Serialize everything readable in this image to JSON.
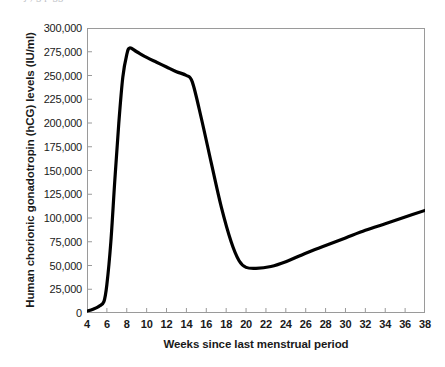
{
  "page": {
    "cut_off_text_sliver": "j                  ,                      g  p              gg"
  },
  "chart_data": {
    "type": "line",
    "title": "",
    "xlabel": "Weeks since last menstrual period",
    "ylabel": "Human chorionic gonadotropin (hCG) levels (IU/ml)",
    "xlim": [
      4,
      38
    ],
    "ylim": [
      0,
      300000
    ],
    "xticks": [
      4,
      6,
      8,
      10,
      12,
      14,
      16,
      18,
      20,
      22,
      24,
      26,
      28,
      30,
      32,
      34,
      36,
      38
    ],
    "xtick_labels": [
      "4",
      "6",
      "8",
      "10",
      "12",
      "14",
      "16",
      "18",
      "20",
      "22",
      "24",
      "26",
      "28",
      "30",
      "32",
      "34",
      "36",
      "38"
    ],
    "yticks": [
      0,
      25000,
      50000,
      75000,
      100000,
      125000,
      150000,
      175000,
      200000,
      225000,
      250000,
      275000,
      300000
    ],
    "ytick_labels": [
      "0",
      "25,000",
      "50,000",
      "75,000",
      "100,000",
      "125,000",
      "150,000",
      "175,000",
      "200,000",
      "225,000",
      "250,000",
      "275,000",
      "300,000"
    ],
    "grid": false,
    "legend": null,
    "line_color": "#000000",
    "line_width": 3.2,
    "frame_color": "#9a9a9a",
    "series": [
      {
        "name": "hCG level",
        "x": [
          4,
          4.6,
          5.2,
          5.7,
          6.0,
          6.4,
          6.8,
          7.2,
          7.6,
          8.0,
          8.3,
          9.0,
          10.0,
          11.0,
          12.0,
          13.0,
          14.0,
          14.6,
          15.5,
          16.5,
          17.5,
          18.5,
          19.3,
          20.0,
          21.0,
          22.5,
          24.0,
          26.0,
          28.0,
          30.0,
          32.0,
          34.0,
          36.0,
          38.0
        ],
        "y": [
          2000,
          4000,
          7000,
          12000,
          30000,
          75000,
          140000,
          200000,
          248000,
          272000,
          279000,
          275000,
          269000,
          264000,
          259000,
          254000,
          250000,
          243000,
          205000,
          158000,
          112000,
          75000,
          55000,
          48000,
          47000,
          49000,
          54000,
          63000,
          71000,
          79000,
          87000,
          94000,
          101000,
          108000
        ]
      }
    ],
    "annotations": {
      "peak_week": 8.3,
      "peak_value": 279000,
      "trough_week": 20.5,
      "trough_value": 47000,
      "final_week": 38,
      "final_value": 108000
    }
  }
}
